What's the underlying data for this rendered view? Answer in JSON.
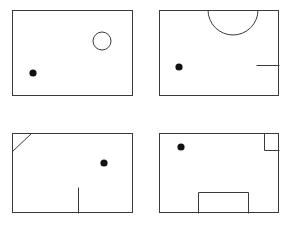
{
  "figure": {
    "canvas": {
      "width": 293,
      "height": 227
    },
    "background_color": "#ffffff",
    "line_color": "#3a3a3a",
    "dot_color": "#111111",
    "panel_count": 4,
    "panels": [
      {
        "id": "panel-top-left",
        "position": "top-left",
        "outline": {
          "x": 12,
          "y": 10,
          "width": 121,
          "height": 86
        },
        "features": [
          {
            "kind": "open-circle",
            "name": "circle-marker",
            "cx": 102,
            "cy": 41,
            "r": 9,
            "fill": "#ffffff"
          }
        ],
        "dot": {
          "cx": 33,
          "cy": 73,
          "r": 3.6
        }
      },
      {
        "id": "panel-top-right",
        "position": "top-right",
        "outline": {
          "x": 159,
          "y": 10,
          "width": 120,
          "height": 86
        },
        "features": [
          {
            "kind": "semicircle-arc",
            "name": "semicircle-arc",
            "cx": 233,
            "cy": 10,
            "r": 25,
            "path": "M 208 10 A 25 25 0 0 0 258 10"
          },
          {
            "kind": "line",
            "name": "wall-stub-line",
            "x1": 256,
            "y1": 65,
            "x2": 279,
            "y2": 65
          }
        ],
        "dot": {
          "cx": 179,
          "cy": 67,
          "r": 3.6
        }
      },
      {
        "id": "panel-bottom-left",
        "position": "bottom-left",
        "outline": {
          "x": 12,
          "y": 133,
          "width": 121,
          "height": 80
        },
        "features": [
          {
            "kind": "line",
            "name": "corner-diagonal-line",
            "x1": 12,
            "y1": 151,
            "x2": 31,
            "y2": 133
          },
          {
            "kind": "line",
            "name": "partition-vertical-line",
            "x1": 78,
            "y1": 187,
            "x2": 78,
            "y2": 213
          }
        ],
        "dot": {
          "cx": 104,
          "cy": 163,
          "r": 3.6
        }
      },
      {
        "id": "panel-bottom-right",
        "position": "bottom-right",
        "outline": {
          "x": 159,
          "y": 133,
          "width": 120,
          "height": 80
        },
        "features": [
          {
            "kind": "polyline",
            "name": "corner-notch-square",
            "points": "264,133 264,150 279,150"
          },
          {
            "kind": "polyline",
            "name": "bottom-alcove-rectangle",
            "points": "198,213 198,192 248,192 248,213"
          }
        ],
        "dot": {
          "cx": 181,
          "cy": 147,
          "r": 3.6
        }
      }
    ]
  }
}
